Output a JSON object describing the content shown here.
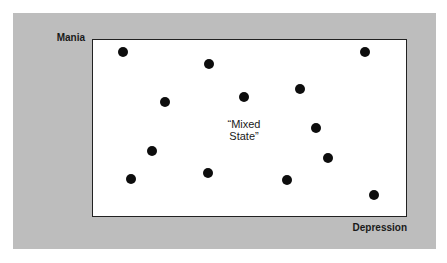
{
  "chart_data": {
    "type": "scatter",
    "title": "",
    "xlabel": "Depression",
    "ylabel": "Mania",
    "annotation": "“Mixed State”",
    "axis_ticks": "none",
    "grid": false,
    "legend": "none",
    "coordinate_note": "Positions normalized to plot frame: x from left (0) to right (1), y from top (0) to bottom (1)",
    "points": [
      {
        "x": 0.095,
        "y": 0.067
      },
      {
        "x": 0.371,
        "y": 0.135
      },
      {
        "x": 0.869,
        "y": 0.067
      },
      {
        "x": 0.229,
        "y": 0.354
      },
      {
        "x": 0.483,
        "y": 0.326
      },
      {
        "x": 0.66,
        "y": 0.281
      },
      {
        "x": 0.714,
        "y": 0.5
      },
      {
        "x": 0.187,
        "y": 0.629
      },
      {
        "x": 0.752,
        "y": 0.669
      },
      {
        "x": 0.121,
        "y": 0.792
      },
      {
        "x": 0.368,
        "y": 0.758
      },
      {
        "x": 0.619,
        "y": 0.798
      },
      {
        "x": 0.898,
        "y": 0.882
      }
    ]
  },
  "labels": {
    "y_axis": "Mania",
    "x_axis": "Depression",
    "annotation_line1": "“Mixed",
    "annotation_line2": "State”"
  },
  "colors": {
    "panel_background": "#bdbdbd",
    "plot_background": "#ffffff",
    "dot": "#0d0d0d",
    "frame": "#222222"
  }
}
